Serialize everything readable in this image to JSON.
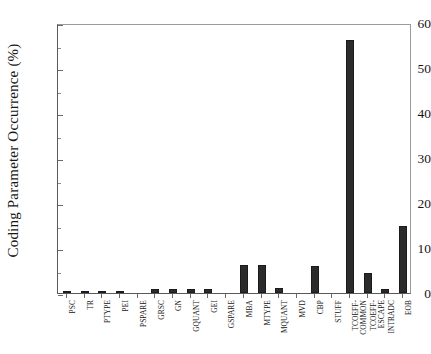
{
  "chart_data": {
    "type": "bar",
    "title": "",
    "xlabel": "",
    "ylabel": "Coding Parameter Occurrence (%)",
    "ylim": [
      0,
      60
    ],
    "ytick_labels": [
      "0",
      "10",
      "20",
      "30",
      "40",
      "50",
      "60"
    ],
    "ytick_values": [
      0,
      10,
      20,
      30,
      40,
      50,
      60
    ],
    "yminor_values": [
      5,
      15,
      25,
      35,
      45,
      55
    ],
    "grid": false,
    "legend": null,
    "categories": [
      "PSC",
      "TR",
      "PTYPE",
      "PEI",
      "PSPARE",
      "GRSC",
      "GN",
      "GQUANT",
      "GEI",
      "GSPARE",
      "MBA",
      "MTYPE",
      "MQUANT",
      "MVD",
      "CBP",
      "STUFF",
      "TCOEFF-COMMON",
      "TCOEFF-ESCAPE",
      "INTRADC",
      "EOB"
    ],
    "values": [
      0.4,
      0.4,
      0.4,
      0.4,
      0,
      0.9,
      0.9,
      0.9,
      0.8,
      0,
      6.2,
      6.2,
      1.1,
      0,
      5.9,
      0,
      56.3,
      4.4,
      1.0,
      15.0
    ],
    "bar_color": "#2b2b2b",
    "bar_edge_color": "#1b1b1b"
  }
}
